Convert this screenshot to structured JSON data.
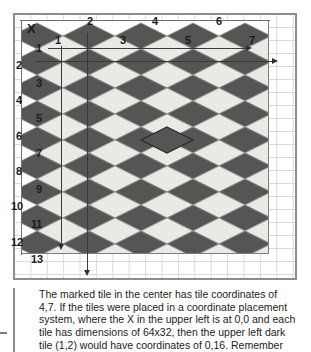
{
  "figure": {
    "title_icon": "isometric-tile-grid",
    "origin_marker": "X",
    "top_axis_labels_even": [
      {
        "text": "2",
        "x": 87,
        "y": 16
      },
      {
        "text": "4",
        "x": 152,
        "y": 16
      },
      {
        "text": "6",
        "x": 216,
        "y": 16
      }
    ],
    "top_axis_labels_odd": [
      {
        "text": "1",
        "x": 55,
        "y": 35
      },
      {
        "text": "3",
        "x": 120,
        "y": 35
      },
      {
        "text": "5",
        "x": 185,
        "y": 35
      },
      {
        "text": "7",
        "x": 249,
        "y": 35
      }
    ],
    "left_axis_labels_even": [
      {
        "text": "2",
        "x": 16,
        "y": 60
      },
      {
        "text": "4",
        "x": 16,
        "y": 95
      },
      {
        "text": "6",
        "x": 16,
        "y": 131
      },
      {
        "text": "8",
        "x": 16,
        "y": 166
      },
      {
        "text": "10",
        "x": 11,
        "y": 201
      },
      {
        "text": "12",
        "x": 11,
        "y": 237
      }
    ],
    "left_axis_labels_odd": [
      {
        "text": "1",
        "x": 36,
        "y": 43
      },
      {
        "text": "3",
        "x": 36,
        "y": 78
      },
      {
        "text": "5",
        "x": 36,
        "y": 113
      },
      {
        "text": "7",
        "x": 36,
        "y": 148
      },
      {
        "text": "9",
        "x": 36,
        "y": 184
      },
      {
        "text": "11",
        "x": 31,
        "y": 219
      },
      {
        "text": "13",
        "x": 31,
        "y": 254
      }
    ],
    "colors": {
      "dark_tile": "#555553",
      "light_tile": "#e9e9e6",
      "tile_edge": "#8f8f8d",
      "frame": "#8d8d8b",
      "grid": "#d9d9d6",
      "axis": "#6f6f6d",
      "arrow": "#2e2e2e",
      "text": "#1c1c1c"
    },
    "tile": {
      "width": 52,
      "height": 26,
      "columns": 5,
      "rows": 9
    },
    "marked_tile": {
      "col": 2,
      "row": 4,
      "label": "marked-center-tile"
    },
    "arrows": [
      {
        "name": "arrow-row1-right",
        "direction": "right"
      },
      {
        "name": "arrow-row2-right",
        "direction": "right"
      },
      {
        "name": "arrow-col1-down",
        "direction": "down"
      },
      {
        "name": "arrow-col2-down",
        "direction": "down"
      }
    ]
  },
  "caption": {
    "text": "The marked tile in the center has tile coordinates of 4,7. If the tiles were placed in a coordinate placement system, where the X in the upper left is at 0,0 and each tile has dimensions of 64x32, then the upper left dark tile (1,2) would have coordinates of 0,16. Remember"
  }
}
